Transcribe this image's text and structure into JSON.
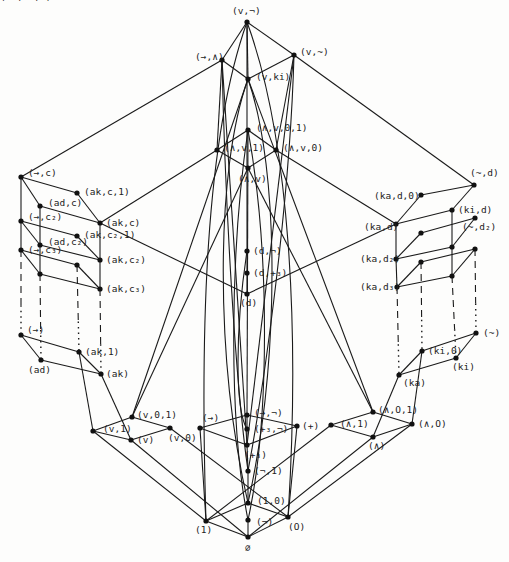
{
  "diagram": {
    "type": "lattice (Hasse diagram)",
    "nodes": [
      {
        "id": "v_neg",
        "label": "(v,¬)",
        "x": 247,
        "y": 22,
        "lx": 232,
        "ly": 14
      },
      {
        "id": "to_and",
        "label": "(→,∧)",
        "x": 222,
        "y": 60,
        "lx": 195,
        "ly": 60
      },
      {
        "id": "v_tilde",
        "label": "(v,~)",
        "x": 294,
        "y": 55,
        "lx": 300,
        "ly": 55
      },
      {
        "id": "v_ki",
        "label": "(v,ki)",
        "x": 248,
        "y": 79,
        "lx": 256,
        "ly": 80
      },
      {
        "id": "and_or_0_1",
        "label": "(∧,v,0,1)",
        "x": 248,
        "y": 130,
        "lx": 256,
        "ly": 131
      },
      {
        "id": "and_or_1",
        "label": "(∧,v,1)",
        "x": 217,
        "y": 150,
        "lx": 224,
        "ly": 151
      },
      {
        "id": "and_or_0",
        "label": "(∧,v,0)",
        "x": 276,
        "y": 150,
        "lx": 283,
        "ly": 151
      },
      {
        "id": "and_or",
        "label": "(∧,v)",
        "x": 248,
        "y": 168,
        "lx": 238,
        "ly": 182
      },
      {
        "id": "to_c",
        "label": "(→,c)",
        "x": 21,
        "y": 177,
        "lx": 28,
        "ly": 176
      },
      {
        "id": "ak_c_1",
        "label": "(ak,c,1)",
        "x": 77,
        "y": 193,
        "lx": 84,
        "ly": 195
      },
      {
        "id": "ad_c",
        "label": "(ad,c)",
        "x": 40,
        "y": 206,
        "lx": 48,
        "ly": 206
      },
      {
        "id": "ak_c",
        "label": "(ak,c)",
        "x": 100,
        "y": 223,
        "lx": 106,
        "ly": 226
      },
      {
        "id": "to_c2",
        "label": "(→,c₂)",
        "x": 21,
        "y": 221,
        "lx": 28,
        "ly": 220
      },
      {
        "id": "ak_c2_1",
        "label": "(ak,c₂,1)",
        "x": 77,
        "y": 236,
        "lx": 84,
        "ly": 238
      },
      {
        "id": "ad_c2",
        "label": "(ad,c₂)",
        "x": 40,
        "y": 245,
        "lx": 48,
        "ly": 245
      },
      {
        "id": "ak_c2",
        "label": "(ak,c₂)",
        "x": 100,
        "y": 260,
        "lx": 106,
        "ly": 263
      },
      {
        "id": "to_c3",
        "label": "(→,c₃)",
        "x": 21,
        "y": 250,
        "lx": 28,
        "ly": 253
      },
      {
        "id": "ak_c3_1",
        "label": "(ak,c₃,1)",
        "x": 77,
        "y": 265,
        "lx": 0,
        "ly": 0
      },
      {
        "id": "ad_c3",
        "label": "",
        "x": 40,
        "y": 274,
        "lx": 0,
        "ly": 0
      },
      {
        "id": "ak_c3",
        "label": "(ak,c₃)",
        "x": 100,
        "y": 289,
        "lx": 106,
        "ly": 292
      },
      {
        "id": "to",
        "label": "(→)",
        "x": 21,
        "y": 335,
        "lx": 27,
        "ly": 333
      },
      {
        "id": "ak_1",
        "label": "(ak,1)",
        "x": 79,
        "y": 352,
        "lx": 85,
        "ly": 355
      },
      {
        "id": "ad",
        "label": "(ad)",
        "x": 41,
        "y": 360,
        "lx": 28,
        "ly": 373
      },
      {
        "id": "ak",
        "label": "(ak)",
        "x": 101,
        "y": 374,
        "lx": 106,
        "ly": 377
      },
      {
        "id": "d_neg",
        "label": "(d,¬)",
        "x": 247,
        "y": 251,
        "lx": 253,
        "ly": 254
      },
      {
        "id": "d_p3",
        "label": "(d,+₃)",
        "x": 247,
        "y": 273,
        "lx": 253,
        "ly": 276
      },
      {
        "id": "d",
        "label": "(d)",
        "x": 247,
        "y": 294,
        "lx": 240,
        "ly": 306
      },
      {
        "id": "tilde_d",
        "label": "(~,d)",
        "x": 474,
        "y": 185,
        "lx": 470,
        "ly": 176
      },
      {
        "id": "ka_d_0",
        "label": "(ka,d,0)",
        "x": 421,
        "y": 195,
        "lx": 374,
        "ly": 199
      },
      {
        "id": "ki_d",
        "label": "(ki,d)",
        "x": 452,
        "y": 210,
        "lx": 458,
        "ly": 213
      },
      {
        "id": "ka_d",
        "label": "(ka,d)",
        "x": 396,
        "y": 224,
        "lx": 364,
        "ly": 230
      },
      {
        "id": "tilde_d2",
        "label": "(~,d₂)",
        "x": 475,
        "y": 218,
        "lx": 462,
        "ly": 230
      },
      {
        "id": "ka_d2_0",
        "label": "",
        "x": 421,
        "y": 233,
        "lx": 0,
        "ly": 0
      },
      {
        "id": "ki_d2",
        "label": "",
        "x": 452,
        "y": 247,
        "lx": 0,
        "ly": 0
      },
      {
        "id": "ka_d2",
        "label": "(ka,d₂)",
        "x": 396,
        "y": 259,
        "lx": 360,
        "ly": 262
      },
      {
        "id": "tilde_d3",
        "label": "",
        "x": 475,
        "y": 249,
        "lx": 0,
        "ly": 0
      },
      {
        "id": "ka_d3_0",
        "label": "",
        "x": 421,
        "y": 262,
        "lx": 0,
        "ly": 0
      },
      {
        "id": "ki_d3",
        "label": "",
        "x": 452,
        "y": 276,
        "lx": 0,
        "ly": 0
      },
      {
        "id": "ka_d3",
        "label": "(ka,d₃)",
        "x": 397,
        "y": 287,
        "lx": 360,
        "ly": 290
      },
      {
        "id": "tilde",
        "label": "(~)",
        "x": 476,
        "y": 333,
        "lx": 483,
        "ly": 336
      },
      {
        "id": "ki_0",
        "label": "(ki,0)",
        "x": 422,
        "y": 351,
        "lx": 428,
        "ly": 354
      },
      {
        "id": "ki",
        "label": "(ki)",
        "x": 456,
        "y": 358,
        "lx": 452,
        "ly": 370
      },
      {
        "id": "ka",
        "label": "(ka)",
        "x": 399,
        "y": 375,
        "lx": 403,
        "ly": 386
      },
      {
        "id": "v_0_1",
        "label": "(v,0,1)",
        "x": 132,
        "y": 417,
        "lx": 137,
        "ly": 418
      },
      {
        "id": "v_1",
        "label": "(v,1)",
        "x": 93,
        "y": 431,
        "lx": 103,
        "ly": 432
      },
      {
        "id": "v_0",
        "label": "(v,0)",
        "x": 170,
        "y": 428,
        "lx": 168,
        "ly": 441
      },
      {
        "id": "v",
        "label": "(v)",
        "x": 131,
        "y": 440,
        "lx": 137,
        "ly": 443
      },
      {
        "id": "to_neg",
        "label": "(→,¬)",
        "x": 247,
        "y": 415,
        "lx": 254,
        "ly": 416
      },
      {
        "id": "to_only",
        "label": "(→)",
        "x": 200,
        "y": 428,
        "lx": 202,
        "ly": 421
      },
      {
        "id": "plus",
        "label": "(+)",
        "x": 297,
        "y": 426,
        "lx": 302,
        "ly": 429
      },
      {
        "id": "p3_neg",
        "label": "(+₃,¬)",
        "x": 247,
        "y": 429,
        "lx": 254,
        "ly": 432
      },
      {
        "id": "p3",
        "label": "(+₃)",
        "x": 247,
        "y": 445,
        "lx": 244,
        "ly": 458
      },
      {
        "id": "neg_1",
        "label": "(¬,1)",
        "x": 248,
        "y": 471,
        "lx": 254,
        "ly": 474
      },
      {
        "id": "one_zero",
        "label": "(1,0)",
        "x": 248,
        "y": 503,
        "lx": 257,
        "ly": 504
      },
      {
        "id": "neg",
        "label": "(¬)",
        "x": 248,
        "y": 520,
        "lx": 256,
        "ly": 525
      },
      {
        "id": "one",
        "label": "(1)",
        "x": 206,
        "y": 521,
        "lx": 195,
        "ly": 533
      },
      {
        "id": "zero",
        "label": "(O)",
        "x": 288,
        "y": 517,
        "lx": 288,
        "ly": 530
      },
      {
        "id": "empty",
        "label": "∅",
        "x": 248,
        "y": 537,
        "lx": 245,
        "ly": 551
      },
      {
        "id": "and_0_1",
        "label": "(∧,O,1)",
        "x": 373,
        "y": 412,
        "lx": 378,
        "ly": 413
      },
      {
        "id": "and_1",
        "label": "(∧,1)",
        "x": 331,
        "y": 425,
        "lx": 340,
        "ly": 427
      },
      {
        "id": "and_0",
        "label": "(∧,O)",
        "x": 412,
        "y": 424,
        "lx": 418,
        "ly": 427
      },
      {
        "id": "and",
        "label": "(∧)",
        "x": 373,
        "y": 437,
        "lx": 368,
        "ly": 449
      }
    ],
    "edges_solid": [
      [
        "v_neg",
        "to_and"
      ],
      [
        "v_neg",
        "v_tilde"
      ],
      [
        "v_neg",
        "v_ki"
      ],
      [
        "to_and",
        "v_ki"
      ],
      [
        "v_tilde",
        "v_ki"
      ],
      [
        "to_and",
        "to_c"
      ],
      [
        "v_tilde",
        "tilde_d"
      ],
      [
        "to_and",
        "and_or_1"
      ],
      [
        "v_tilde",
        "and_or_0"
      ],
      [
        "and_or_0_1",
        "and_or_1"
      ],
      [
        "and_or_0_1",
        "and_or_0"
      ],
      [
        "and_or_1",
        "and_or"
      ],
      [
        "and_or_0",
        "and_or"
      ],
      [
        "to_c",
        "ak_c_1"
      ],
      [
        "to_c",
        "ad_c"
      ],
      [
        "ak_c_1",
        "ak_c"
      ],
      [
        "ad_c",
        "ak_c"
      ],
      [
        "to_c2",
        "ak_c2_1"
      ],
      [
        "to_c2",
        "ad_c2"
      ],
      [
        "ak_c2_1",
        "ak_c2"
      ],
      [
        "ad_c2",
        "ak_c2"
      ],
      [
        "to_c3",
        "ak_c3_1"
      ],
      [
        "to_c3",
        "ad_c3"
      ],
      [
        "ak_c3_1",
        "ak_c3"
      ],
      [
        "ad_c3",
        "ak_c3"
      ],
      [
        "to_c",
        "to_c2"
      ],
      [
        "to_c2",
        "to_c3"
      ],
      [
        "ad_c",
        "ad_c2"
      ],
      [
        "ad_c2",
        "ad_c3"
      ],
      [
        "ak_c",
        "ak_c2"
      ],
      [
        "ak_c2",
        "ak_c3"
      ],
      [
        "to",
        "ak_1"
      ],
      [
        "to",
        "ad"
      ],
      [
        "ak_1",
        "ak"
      ],
      [
        "ad",
        "ak"
      ],
      [
        "tilde_d",
        "ka_d_0"
      ],
      [
        "tilde_d",
        "ki_d"
      ],
      [
        "ka_d_0",
        "ka_d"
      ],
      [
        "ki_d",
        "ka_d"
      ],
      [
        "tilde_d2",
        "ka_d2_0"
      ],
      [
        "tilde_d2",
        "ki_d2"
      ],
      [
        "ka_d2_0",
        "ka_d2"
      ],
      [
        "ki_d2",
        "ka_d2"
      ],
      [
        "tilde_d3",
        "ka_d3_0"
      ],
      [
        "tilde_d3",
        "ki_d3"
      ],
      [
        "ka_d3_0",
        "ka_d3"
      ],
      [
        "ki_d3",
        "ka_d3"
      ],
      [
        "ki_d",
        "ki_d2"
      ],
      [
        "ki_d2",
        "ki_d3"
      ],
      [
        "ka_d",
        "ka_d2"
      ],
      [
        "ka_d2",
        "ka_d3"
      ],
      [
        "tilde",
        "ki_0"
      ],
      [
        "tilde",
        "ki"
      ],
      [
        "ki_0",
        "ka"
      ],
      [
        "ki",
        "ka"
      ],
      [
        "and_or_1",
        "ak_c"
      ],
      [
        "and_or_0",
        "ka_d"
      ],
      [
        "ak_c",
        "d"
      ],
      [
        "ka_d",
        "d"
      ],
      [
        "d_neg",
        "d_p3"
      ],
      [
        "d_p3",
        "d"
      ],
      [
        "v_0_1",
        "v_1"
      ],
      [
        "v_0_1",
        "v_0"
      ],
      [
        "v_1",
        "v"
      ],
      [
        "v_0",
        "v"
      ],
      [
        "ak_1",
        "v_1"
      ],
      [
        "ak",
        "v"
      ],
      [
        "and_0_1",
        "and_1"
      ],
      [
        "and_0_1",
        "and_0"
      ],
      [
        "and_1",
        "and"
      ],
      [
        "and_0",
        "and"
      ],
      [
        "ka",
        "and"
      ],
      [
        "ki_0",
        "and_0"
      ],
      [
        "to_neg",
        "to_only"
      ],
      [
        "to_neg",
        "plus"
      ],
      [
        "to_only",
        "p3"
      ],
      [
        "plus",
        "p3"
      ],
      [
        "to_neg",
        "p3_neg"
      ],
      [
        "p3_neg",
        "p3"
      ],
      [
        "p3",
        "neg_1"
      ],
      [
        "neg_1",
        "one_zero"
      ],
      [
        "one_zero",
        "one"
      ],
      [
        "one_zero",
        "zero"
      ],
      [
        "one",
        "empty"
      ],
      [
        "zero",
        "empty"
      ],
      [
        "neg",
        "empty"
      ],
      [
        "v_1",
        "one"
      ],
      [
        "v",
        "empty"
      ],
      [
        "v_0",
        "zero"
      ],
      [
        "and_1",
        "one"
      ],
      [
        "and",
        "empty"
      ],
      [
        "and_0",
        "zero"
      ],
      [
        "to_only",
        "one"
      ],
      [
        "plus",
        "zero"
      ],
      [
        "v_ki",
        "v_0_1"
      ],
      [
        "v_ki",
        "and_0_1"
      ],
      [
        "to_and",
        "p3"
      ],
      [
        "v_tilde",
        "p3"
      ],
      [
        "and_or",
        "v_0_1"
      ],
      [
        "and_or",
        "and_0_1"
      ],
      [
        "and_or_0_1",
        "to_neg"
      ],
      [
        "v_neg",
        "d_neg"
      ]
    ],
    "edges_dashed_vertical": [
      [
        "to_c3",
        "to"
      ],
      [
        "ad_c3",
        "ad"
      ],
      [
        "ak_c3_1",
        "ak_1"
      ],
      [
        "ak_c3",
        "ak"
      ],
      [
        "ka_d3",
        "ka"
      ],
      [
        "ka_d3_0",
        "ki_0"
      ],
      [
        "ki_d3",
        "ki"
      ],
      [
        "tilde_d3",
        "tilde"
      ]
    ]
  }
}
